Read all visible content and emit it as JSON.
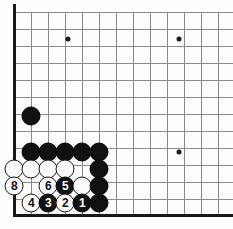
{
  "board": {
    "title": "Go board diagram — bottom left corner joseki",
    "grid": {
      "spacing": 17,
      "origin_x": 14,
      "origin_y": 12,
      "cols": 13,
      "rows": 12,
      "line_color": "#8a8a8a",
      "edge_color": "#1a1a1a",
      "background": "#fdfdfd"
    },
    "edges": {
      "left_label": "left-board-edge",
      "bottom_label": "bottom-board-edge"
    },
    "star_points": [
      {
        "name": "star-point-upper-left",
        "x": 68,
        "y": 39
      },
      {
        "name": "star-point-upper-right",
        "x": 179,
        "y": 39
      },
      {
        "name": "star-point-right",
        "x": 179,
        "y": 152
      }
    ],
    "stones": [
      {
        "name": "black-stone-a",
        "color": "black",
        "x": 31,
        "y": 116,
        "label": ""
      },
      {
        "name": "black-stone-b",
        "color": "black",
        "x": 31,
        "y": 152,
        "label": ""
      },
      {
        "name": "black-stone-c",
        "color": "black",
        "x": 48,
        "y": 152,
        "label": ""
      },
      {
        "name": "black-stone-d",
        "color": "black",
        "x": 65,
        "y": 152,
        "label": ""
      },
      {
        "name": "black-stone-e",
        "color": "black",
        "x": 82,
        "y": 152,
        "label": ""
      },
      {
        "name": "black-stone-f",
        "color": "black",
        "x": 99,
        "y": 152,
        "label": ""
      },
      {
        "name": "white-stone-a",
        "color": "white",
        "x": 14,
        "y": 169,
        "label": ""
      },
      {
        "name": "white-stone-b",
        "color": "white",
        "x": 31,
        "y": 169,
        "label": ""
      },
      {
        "name": "white-stone-c",
        "color": "white",
        "x": 48,
        "y": 169,
        "label": ""
      },
      {
        "name": "white-stone-d",
        "color": "white",
        "x": 65,
        "y": 169,
        "label": ""
      },
      {
        "name": "black-stone-g",
        "color": "black",
        "x": 99,
        "y": 169,
        "label": ""
      },
      {
        "name": "move-8-white",
        "color": "white",
        "x": 14,
        "y": 186,
        "label": "8"
      },
      {
        "name": "move-6-white",
        "color": "white",
        "x": 48,
        "y": 186,
        "label": "6"
      },
      {
        "name": "move-5-black",
        "color": "black",
        "x": 65,
        "y": 186,
        "label": "5"
      },
      {
        "name": "white-stone-e",
        "color": "white",
        "x": 82,
        "y": 186,
        "label": ""
      },
      {
        "name": "black-stone-h",
        "color": "black",
        "x": 99,
        "y": 186,
        "label": ""
      },
      {
        "name": "move-4-white",
        "color": "white",
        "x": 31,
        "y": 203,
        "label": "4"
      },
      {
        "name": "move-3-black",
        "color": "black",
        "x": 48,
        "y": 203,
        "label": "3"
      },
      {
        "name": "move-2-white",
        "color": "white",
        "x": 65,
        "y": 203,
        "label": "2"
      },
      {
        "name": "move-1-black",
        "color": "black",
        "x": 82,
        "y": 203,
        "label": "1"
      },
      {
        "name": "black-stone-i",
        "color": "black",
        "x": 99,
        "y": 203,
        "label": ""
      }
    ]
  }
}
